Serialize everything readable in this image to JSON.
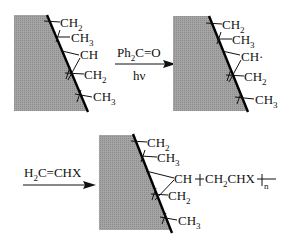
{
  "diagram": {
    "type": "reaction-scheme",
    "colors": {
      "surface_fill": "#9a9a9a",
      "line": "#111111",
      "background": "#ffffff"
    },
    "step1": {
      "reagent": "Ph",
      "reagent_sub": "2",
      "reagent_rest": "C=O",
      "condition": "hν"
    },
    "step2": {
      "reagent_a": "H",
      "reagent_a_sub": "2",
      "reagent_rest": "C=CHX"
    },
    "panel1": {
      "groups": [
        {
          "main": "CH",
          "sub": "2"
        },
        {
          "main": "CH",
          "sub": "3"
        },
        {
          "main": "CH",
          "sub": ""
        },
        {
          "main": "CH",
          "sub": "2"
        },
        {
          "main": "CH",
          "sub": "3"
        }
      ]
    },
    "panel2": {
      "groups": [
        {
          "main": "CH",
          "sub": "2"
        },
        {
          "main": "CH",
          "sub": "3"
        },
        {
          "main": "CH·",
          "sub": ""
        },
        {
          "main": "CH",
          "sub": "2"
        },
        {
          "main": "CH",
          "sub": "3"
        }
      ]
    },
    "panel3": {
      "groups": [
        {
          "main": "CH",
          "sub": "2"
        },
        {
          "main": "CH",
          "sub": "3"
        },
        {
          "main": "CH",
          "sub": ""
        },
        {
          "main": "CH",
          "sub": "2"
        },
        {
          "main": "CH",
          "sub": "3"
        }
      ],
      "graft_chain": {
        "open_bracket": "┼",
        "unit_a": "CH",
        "unit_a_sub": "2",
        "unit_b": "CHX",
        "close_bracket": "┼",
        "repeat": "n"
      }
    }
  }
}
